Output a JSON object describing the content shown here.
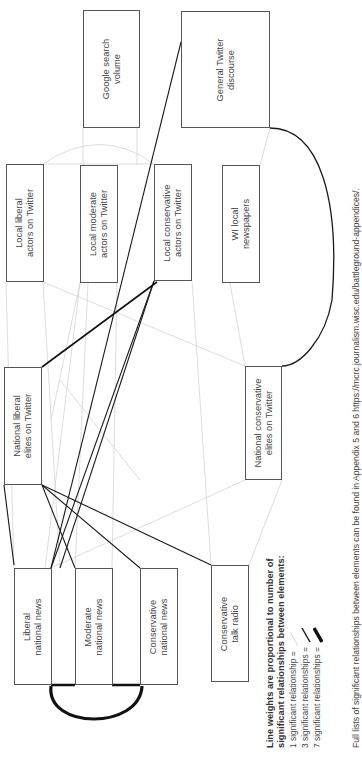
{
  "nodes": {
    "google_search": {
      "lines": [
        "Google search",
        "volume"
      ]
    },
    "general_twitter": {
      "lines": [
        "General Twitter",
        "discourse"
      ]
    },
    "local_liberal": {
      "lines": [
        "Local liberal",
        "actors on Twitter"
      ]
    },
    "local_moderate": {
      "lines": [
        "Local moderate",
        "actors on Twitter"
      ]
    },
    "local_conservative": {
      "lines": [
        "Local conservative",
        "actors on Twitter"
      ]
    },
    "wi_local_newspapers": {
      "lines": [
        "WI local",
        "newspapers"
      ]
    },
    "national_liberal_elites": {
      "lines": [
        "National liberal",
        "elites on Twitter"
      ]
    },
    "national_conservative_elites": {
      "lines": [
        "National conservative",
        "elites on Twitter"
      ]
    },
    "liberal_national_news": {
      "lines": [
        "Liberal",
        "national news"
      ]
    },
    "moderate_national_news": {
      "lines": [
        "Moderate",
        "national news"
      ]
    },
    "conservative_national_news": {
      "lines": [
        "Conservative",
        "national news"
      ]
    },
    "conservative_talk_radio": {
      "lines": [
        "Conservative",
        "talk radio"
      ]
    }
  },
  "legend": {
    "title_line1": "Line weights are proportional to number of",
    "title_line2": "significant relationships between elements:",
    "items": [
      {
        "label": "1 significant relationship =",
        "weight": 1
      },
      {
        "label": "3 significant relationships =",
        "weight": 3
      },
      {
        "label": "7 significant relationships =",
        "weight": 7
      }
    ]
  },
  "footnote": "Full lists of significant relationships between elements can be found in Appendix 5 and 6 https://mcrc.journalism.wisc.edu/battleground-appendices/.",
  "colors": {
    "box_border": "#555555",
    "strong_edge": "#111111",
    "weak_edge": "#cccccc"
  }
}
